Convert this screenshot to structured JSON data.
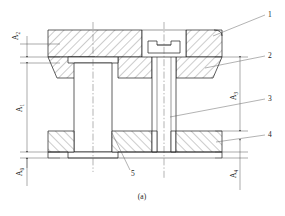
{
  "figure": {
    "caption": "(a)",
    "type": "engineering-assembly-cross-section"
  },
  "dimensions": [
    {
      "id": "A2",
      "base": "A",
      "sub": "2",
      "label": "A₂",
      "side": "left",
      "position": "upper"
    },
    {
      "id": "A1",
      "base": "A",
      "sub": "1",
      "label": "A₁",
      "side": "left",
      "position": "middle"
    },
    {
      "id": "A0",
      "base": "A",
      "sub": "0",
      "label": "A₀",
      "side": "left",
      "position": "lower"
    },
    {
      "id": "A3",
      "base": "A",
      "sub": "3",
      "label": "A₃",
      "side": "right",
      "position": "upper"
    },
    {
      "id": "A4",
      "base": "A",
      "sub": "4",
      "label": "A₄",
      "side": "right",
      "position": "lower"
    }
  ],
  "callouts": [
    {
      "id": "1",
      "label": "1",
      "side": "right",
      "target": "upper-die-block"
    },
    {
      "id": "2",
      "label": "2",
      "side": "right",
      "target": "die-bolster"
    },
    {
      "id": "3",
      "label": "3",
      "side": "right",
      "target": "guide-pillar-bore"
    },
    {
      "id": "4",
      "label": "4",
      "side": "right",
      "target": "lower-base-plate"
    },
    {
      "id": "5",
      "label": "5",
      "side": "bottom",
      "target": "guide-bush"
    }
  ],
  "parts": {
    "upper_block": "upper-die-block",
    "bolster": "die-bolster",
    "left_post": "guide-pillar",
    "center_shaft": "center-guide-pin",
    "screw_head": "counterbored-slotted-screw",
    "lower_plate": "lower-base-plate",
    "bush": "guide-bush"
  },
  "colors": {
    "line": "#1a1a1a",
    "thin": "#444444",
    "background": "#ffffff",
    "hatch": "#333333"
  }
}
